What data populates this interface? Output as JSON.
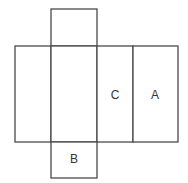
{
  "diagram": {
    "type": "cube-net",
    "stroke_color": "#4a4a4a",
    "faces": [
      {
        "id": "top",
        "label": "",
        "x": 51,
        "y": 9,
        "w": 46,
        "h": 37
      },
      {
        "id": "left",
        "label": "",
        "x": 15,
        "y": 46,
        "w": 36,
        "h": 96
      },
      {
        "id": "center",
        "label": "",
        "x": 51,
        "y": 46,
        "w": 46,
        "h": 96
      },
      {
        "id": "c",
        "label": "C",
        "x": 97,
        "y": 46,
        "w": 36,
        "h": 96
      },
      {
        "id": "a",
        "label": "A",
        "x": 133,
        "y": 46,
        "w": 45,
        "h": 96
      },
      {
        "id": "b",
        "label": "B",
        "x": 51,
        "y": 142,
        "w": 46,
        "h": 36
      }
    ]
  }
}
